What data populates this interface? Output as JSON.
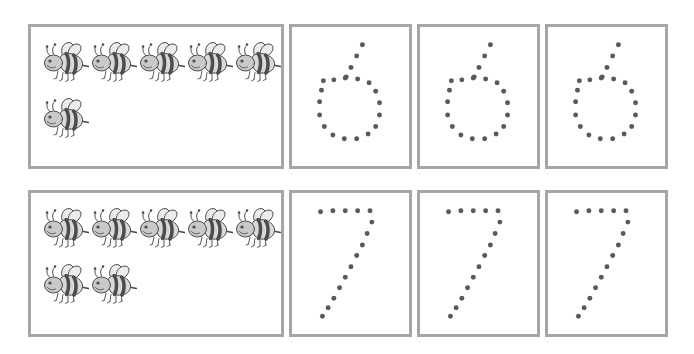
{
  "worksheet": {
    "title": "Number tracing worksheet: counting bees and tracing numerals 6 and 7",
    "ink_color": "#595959",
    "frame_color": "#a6a6a6",
    "page_background": "#ffffff",
    "rows": [
      {
        "id": "row-6",
        "numeral": "6",
        "bee_count": 6,
        "bee_count_label": "6",
        "bee_rows": [
          5,
          1
        ],
        "trace_box_count": 3,
        "trace_boxes": [
          {
            "id": "trace-6-a",
            "numeral": "6",
            "dot_count": 20
          },
          {
            "id": "trace-6-b",
            "numeral": "6",
            "dot_count": 20
          },
          {
            "id": "trace-6-c",
            "numeral": "6",
            "dot_count": 20
          }
        ]
      },
      {
        "id": "row-7",
        "numeral": "7",
        "bee_count": 7,
        "bee_count_label": "7",
        "bee_rows": [
          5,
          2
        ],
        "trace_box_count": 3,
        "trace_boxes": [
          {
            "id": "trace-7-a",
            "numeral": "7",
            "dot_count": 15
          },
          {
            "id": "trace-7-b",
            "numeral": "7",
            "dot_count": 15
          },
          {
            "id": "trace-7-c",
            "numeral": "7",
            "dot_count": 15
          }
        ]
      }
    ]
  },
  "glyph_dots": {
    "six": [
      [
        74,
        18
      ],
      [
        68,
        30
      ],
      [
        62,
        42
      ],
      [
        56,
        53
      ],
      [
        44,
        55
      ],
      [
        33,
        56
      ],
      [
        57,
        52
      ],
      [
        69,
        54
      ],
      [
        81,
        58
      ],
      [
        88,
        67
      ],
      [
        92,
        79
      ],
      [
        92,
        92
      ],
      [
        88,
        104
      ],
      [
        80,
        112
      ],
      [
        68,
        117
      ],
      [
        55,
        117
      ],
      [
        43,
        113
      ],
      [
        34,
        104
      ],
      [
        29,
        92
      ],
      [
        29,
        78
      ],
      [
        31,
        66
      ]
    ],
    "seven": [
      [
        30,
        18
      ],
      [
        43,
        17
      ],
      [
        56,
        17
      ],
      [
        69,
        17
      ],
      [
        82,
        17
      ],
      [
        84,
        29
      ],
      [
        79,
        41
      ],
      [
        74,
        53
      ],
      [
        68,
        64
      ],
      [
        62,
        76
      ],
      [
        56,
        87
      ],
      [
        50,
        98
      ],
      [
        44,
        109
      ],
      [
        38,
        119
      ],
      [
        32,
        128
      ]
    ]
  },
  "bee": {
    "name": "bee-illustration",
    "description": "Cartoon bumblebee facing left with two wings, striped abdomen and stinger",
    "colors": {
      "body_light": "#d9d9d9",
      "body_dark": "#4d4d4d",
      "wing": "#ebebeb",
      "outline": "#4a4a4a",
      "head": "#c9c9c9"
    }
  }
}
